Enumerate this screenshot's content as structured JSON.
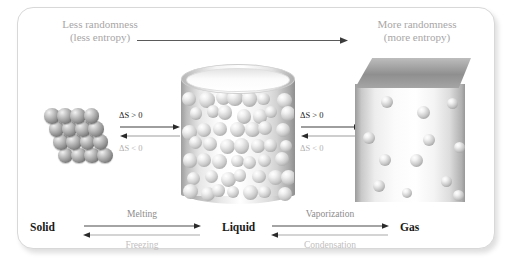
{
  "figure": {
    "header": {
      "left_line1": "Less randomness",
      "left_line2": "(less entropy)",
      "right_line1": "More randomness",
      "right_line2": "(more entropy)"
    },
    "top_arrow": {
      "direction": "left-to-right",
      "name": "randomness-increase-arrow"
    },
    "states": [
      {
        "id": "solid",
        "label": "Solid",
        "depiction": "ordered-lattice-of-spheres",
        "particle_count": 16
      },
      {
        "id": "liquid",
        "label": "Liquid",
        "depiction": "cylinder-beaker-with-packed-spheres",
        "particle_count": 44
      },
      {
        "id": "gas",
        "label": "Gas",
        "depiction": "cube-container-with-scattered-spheres",
        "particle_count": 12
      }
    ],
    "entropy_markers": [
      {
        "id": "solid-liquid",
        "forward": "ΔS > 0",
        "reverse": "ΔS < 0"
      },
      {
        "id": "liquid-gas",
        "forward": "ΔS > 0",
        "reverse": "ΔS < 0"
      }
    ],
    "transitions": [
      {
        "id": "solid-liquid",
        "forward": "Melting",
        "reverse": "Freezing"
      },
      {
        "id": "liquid-gas",
        "forward": "Vaporization",
        "reverse": "Condensation"
      }
    ],
    "colors": {
      "forward_text": "#1d1d1d",
      "reverse_text": "#b3b1b1",
      "header_text": "#a8a6a6",
      "transition_forward": "#8e8c8c",
      "transition_reverse": "#c2c0c0",
      "frame_border": "#d8d8d8",
      "background": "#ffffff",
      "sphere_solid": "#8a8a8a",
      "sphere_fluid": "#cccccc"
    }
  },
  "chart_data": {
    "type": "diagram",
    "axis_annotation": "Randomness (entropy) increases from left to right",
    "nodes": [
      "Solid",
      "Liquid",
      "Gas"
    ],
    "edges": [
      {
        "from": "Solid",
        "to": "Liquid",
        "label": "Melting",
        "entropy": "ΔS > 0"
      },
      {
        "from": "Liquid",
        "to": "Solid",
        "label": "Freezing",
        "entropy": "ΔS < 0"
      },
      {
        "from": "Liquid",
        "to": "Gas",
        "label": "Vaporization",
        "entropy": "ΔS > 0"
      },
      {
        "from": "Gas",
        "to": "Liquid",
        "label": "Condensation",
        "entropy": "ΔS < 0"
      }
    ],
    "particle_counts": {
      "Solid": 16,
      "Liquid": 44,
      "Gas": 12
    }
  }
}
